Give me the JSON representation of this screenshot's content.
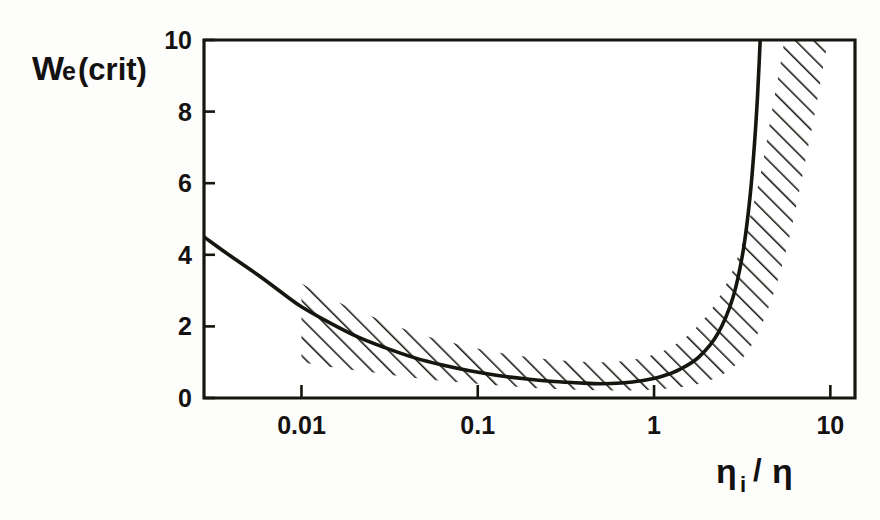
{
  "figure": {
    "background_color": "#fdfdfc",
    "ink_color": "#17150f"
  },
  "chart_data": {
    "type": "line",
    "title": "",
    "subtitle": "",
    "xlabel": "ηi /η",
    "xlabel_parts": {
      "numerator_symbol": "η",
      "numerator_subscript": "i",
      "separator": "/",
      "denominator_symbol": "η"
    },
    "ylabel": "We(crit)",
    "ylabel_parts": {
      "main": "W",
      "subscript": "e",
      "qualifier": "(crit)"
    },
    "xscale": "log",
    "yscale": "linear",
    "xlim": [
      0.0028,
      13.8
    ],
    "ylim": [
      0,
      10
    ],
    "xticks": [
      0.01,
      0.1,
      1,
      10
    ],
    "xtick_labels": [
      "0.01",
      "0.1",
      "1",
      "10"
    ],
    "yticks": [
      0,
      2,
      4,
      6,
      8,
      10
    ],
    "ytick_labels": [
      "0",
      "2",
      "4",
      "6",
      "8",
      "10"
    ],
    "grid": false,
    "legend": "none",
    "series": [
      {
        "name": "We(crit) curve",
        "style": "solid-line",
        "x": [
          0.0028,
          0.004,
          0.0058,
          0.0082,
          0.01,
          0.0145,
          0.021,
          0.03,
          0.044,
          0.063,
          0.09,
          0.13,
          0.19,
          0.27,
          0.38,
          0.5,
          0.65,
          0.85,
          1.1,
          1.4,
          1.8,
          2.3,
          2.8,
          3.2,
          3.5,
          3.7,
          3.85,
          3.95,
          4.0
        ],
        "y": [
          4.5,
          3.95,
          3.4,
          2.85,
          2.55,
          2.1,
          1.7,
          1.4,
          1.12,
          0.92,
          0.76,
          0.63,
          0.53,
          0.46,
          0.42,
          0.4,
          0.42,
          0.48,
          0.6,
          0.8,
          1.15,
          1.8,
          2.8,
          4.1,
          5.6,
          7.0,
          8.3,
          9.4,
          10.0
        ]
      }
    ],
    "band": {
      "name": "uncertainty band (hatched)",
      "fill": "diagonal-hatch",
      "x_start": 0.01,
      "upper": {
        "x": [
          0.01,
          0.015,
          0.023,
          0.035,
          0.052,
          0.078,
          0.115,
          0.17,
          0.25,
          0.36,
          0.52,
          0.72,
          0.95,
          1.25,
          1.6,
          2.1,
          2.7,
          3.3,
          4.0,
          4.7,
          5.2,
          5.5
        ],
        "y": [
          3.2,
          2.75,
          2.35,
          2.0,
          1.72,
          1.5,
          1.32,
          1.18,
          1.08,
          1.02,
          1.0,
          1.05,
          1.18,
          1.42,
          1.8,
          2.45,
          3.4,
          4.6,
          6.2,
          8.1,
          9.3,
          10.0
        ]
      },
      "lower": {
        "x": [
          0.01,
          0.015,
          0.023,
          0.035,
          0.052,
          0.078,
          0.115,
          0.17,
          0.25,
          0.36,
          0.52,
          0.72,
          0.95,
          1.25,
          1.6,
          2.1,
          2.8,
          3.6,
          4.6,
          5.8,
          7.0,
          8.2,
          9.3,
          9.8
        ],
        "y": [
          1.0,
          0.86,
          0.74,
          0.62,
          0.52,
          0.44,
          0.37,
          0.31,
          0.26,
          0.23,
          0.21,
          0.21,
          0.23,
          0.27,
          0.34,
          0.5,
          0.85,
          1.5,
          2.7,
          4.4,
          6.3,
          8.0,
          9.5,
          10.0
        ]
      }
    },
    "annotations": []
  }
}
